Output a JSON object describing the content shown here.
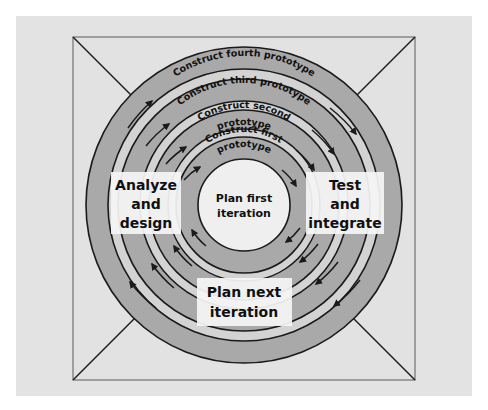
{
  "figure": {
    "type": "spiral-process-diagram"
  },
  "colors": {
    "page_background": "#ffffff",
    "panel_background": "#e3e3e3",
    "frame_interior": "#e0e0e0",
    "band_dark": "#a8a8a8",
    "band_light": "#d2d2d2",
    "center_fill": "#eeeeee",
    "stroke": "#1a1a1a",
    "label_box": "#f5f5f5",
    "text": "#101010"
  },
  "quadrants": [
    {
      "name": "analyze-and-design",
      "position": "left",
      "lines": [
        "Analyze",
        "and",
        "design"
      ]
    },
    {
      "name": "test-and-integrate",
      "position": "right",
      "lines": [
        "Test",
        "and",
        "integrate"
      ]
    },
    {
      "name": "plan-next-iteration",
      "position": "bottom",
      "lines": [
        "Plan next",
        "iteration"
      ]
    }
  ],
  "center": {
    "name": "plan-first-iteration",
    "lines": [
      "Plan first",
      "iteration"
    ]
  },
  "spiral_labels": [
    {
      "name": "construct-fourth-prototype",
      "ring": 4,
      "lines": [
        "Construct fourth prototype"
      ]
    },
    {
      "name": "construct-third-prototype",
      "ring": 3,
      "lines": [
        "Construct third prototype"
      ]
    },
    {
      "name": "construct-second-prototype",
      "ring": 2,
      "lines": [
        "Construct second",
        "prototype"
      ]
    },
    {
      "name": "construct-first-prototype",
      "ring": 1,
      "lines": [
        "Construct first",
        "prototype"
      ]
    }
  ],
  "geometry": {
    "center_x": 244,
    "center_y": 205,
    "rings": [
      4,
      3,
      2,
      1
    ],
    "arrow_direction": "clockwise"
  }
}
